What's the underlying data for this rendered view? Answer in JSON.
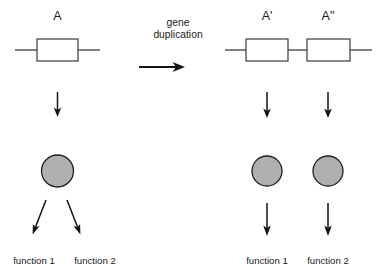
{
  "diagram": {
    "background_color": "#ffffff",
    "line_color": "#1a1a1a",
    "gene_fill_color": "#ffffff",
    "protein_fill_color": "#b0b0b0"
  },
  "process": {
    "label_line1": "gene",
    "label_line2": "duplication",
    "arrow_name": "rightward-process-arrow"
  },
  "before": {
    "gene": {
      "label": "A",
      "box_name": "gene-box-A",
      "chromosome_line_name": "chromosome-line-before"
    },
    "product": {
      "circle_name": "protein-circle-A"
    },
    "functions": [
      {
        "label": "function 1"
      },
      {
        "label": "function 2"
      }
    ],
    "expression_arrow_name": "expression-arrow-A",
    "function_arrows": [
      "function-arrow-A-left",
      "function-arrow-A-right"
    ]
  },
  "after": {
    "genes": [
      {
        "label": "A'",
        "box_name": "gene-box-A-prime",
        "product_circle_name": "protein-circle-A-prime",
        "expression_arrow_name": "expression-arrow-A-prime",
        "function_arrow_name": "function-arrow-A-prime",
        "function": "function 1"
      },
      {
        "label": "A\"",
        "box_name": "gene-box-A-double-prime",
        "product_circle_name": "protein-circle-A-double-prime",
        "expression_arrow_name": "expression-arrow-A-double-prime",
        "function_arrow_name": "function-arrow-A-double-prime",
        "function": "function 2"
      }
    ],
    "chromosome_line_name": "chromosome-line-after"
  }
}
